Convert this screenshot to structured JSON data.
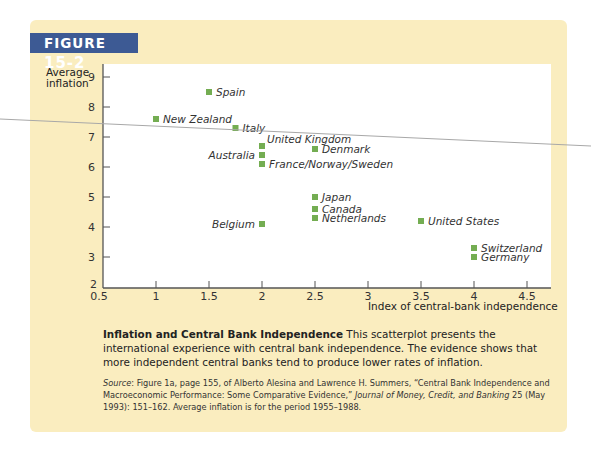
{
  "figure": {
    "tag_prefix": "FIGURE",
    "tag_number": "15-2",
    "header_color": "#3d5a94",
    "panel_color": "#faedbf",
    "marker_color": "#74ad52"
  },
  "axes": {
    "ylabel_line1": "Average",
    "ylabel_line2": "inflation",
    "xlabel": "Index of central-bank independence"
  },
  "caption": {
    "title": "Inflation and Central Bank Independence",
    "body": " This scatterplot presents the international experience with central bank independence. The evidence shows that more independent central banks tend to produce lower rates of inflation."
  },
  "source": {
    "label": "Source",
    "text1": ": Figure 1a, page 155, of Alberto Alesina and Lawrence H. Summers, “Central Bank Independence and Macroeconomic Performance: Some Comparative Evidence,” ",
    "journal": "Journal of Money, Credit, and Banking",
    "text2": " 25 (May 1993): 151–162. Average inflation is for the period 1955–1988."
  },
  "chart_data": {
    "type": "scatter",
    "title": "Inflation and Central Bank Independence",
    "xlabel": "Index of central-bank independence",
    "ylabel": "Average inflation",
    "xlim": [
      0.5,
      4.75
    ],
    "ylim": [
      2,
      9.3
    ],
    "xticks": [
      0.5,
      1,
      1.5,
      2,
      2.5,
      3,
      3.5,
      4,
      4.5
    ],
    "yticks": [
      2,
      3,
      4,
      5,
      6,
      7,
      8,
      9
    ],
    "grid": false,
    "legend": "none",
    "points": [
      {
        "label": "Spain",
        "x": 1.5,
        "y": 8.5,
        "label_side": "right"
      },
      {
        "label": "New Zealand",
        "x": 1.0,
        "y": 7.6,
        "label_side": "right"
      },
      {
        "label": "Italy",
        "x": 1.75,
        "y": 7.3,
        "label_side": "right"
      },
      {
        "label": "United Kingdom",
        "x": 2.0,
        "y": 6.7,
        "label_side": "right-up"
      },
      {
        "label": "Australia",
        "x": 2.0,
        "y": 6.4,
        "label_side": "left"
      },
      {
        "label": "France/Norway/Sweden",
        "x": 2.0,
        "y": 6.1,
        "label_side": "right"
      },
      {
        "label": "Denmark",
        "x": 2.5,
        "y": 6.6,
        "label_side": "right"
      },
      {
        "label": "Japan",
        "x": 2.5,
        "y": 5.0,
        "label_side": "right"
      },
      {
        "label": "Canada",
        "x": 2.5,
        "y": 4.6,
        "label_side": "right"
      },
      {
        "label": "Netherlands",
        "x": 2.5,
        "y": 4.3,
        "label_side": "right"
      },
      {
        "label": "Belgium",
        "x": 2.0,
        "y": 4.1,
        "label_side": "left"
      },
      {
        "label": "United States",
        "x": 3.5,
        "y": 4.2,
        "label_side": "right"
      },
      {
        "label": "Switzerland",
        "x": 4.0,
        "y": 3.3,
        "label_side": "right"
      },
      {
        "label": "Germany",
        "x": 4.0,
        "y": 3.0,
        "label_side": "right"
      }
    ]
  }
}
